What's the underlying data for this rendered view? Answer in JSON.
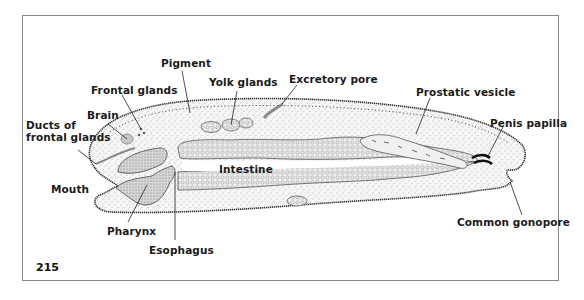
{
  "figure": {
    "number": "215"
  },
  "labels": {
    "pigment": "Pigment",
    "frontal_glands": "Frontal glands",
    "yolk_glands": "Yolk glands",
    "excretory_pore": "Excretory pore",
    "prostatic_vesicle": "Prostatic vesicle",
    "brain": "Brain",
    "ducts_line1": "Ducts of",
    "ducts_line2": "frontal glands",
    "penis_papilla": "Penis papilla",
    "intestine": "Intestine",
    "mouth": "Mouth",
    "pharynx": "Pharynx",
    "esophagus": "Esophagus",
    "common_gonopore": "Common gonopore"
  },
  "colors": {
    "ink": "#1a1a1a",
    "frame": "#8a8a8a",
    "stipple": "#b8b8b8",
    "tissue": "#f4f4f4"
  }
}
